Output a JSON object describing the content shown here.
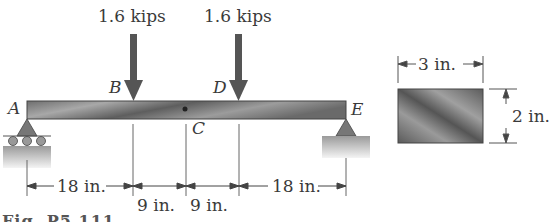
{
  "loads": [
    {
      "label": "1.6 kips",
      "point": "B"
    },
    {
      "label": "1.6 kips",
      "point": "D"
    }
  ],
  "points": {
    "A": "A",
    "B": "B",
    "C": "C",
    "D": "D",
    "E": "E"
  },
  "dimensions": {
    "AB": "18 in.",
    "BC": "9 in.",
    "CD": "9 in.",
    "DE": "18 in."
  },
  "cross_section": {
    "width": "3 in.",
    "height": "2 in."
  },
  "caption": "Fig. P5.111"
}
